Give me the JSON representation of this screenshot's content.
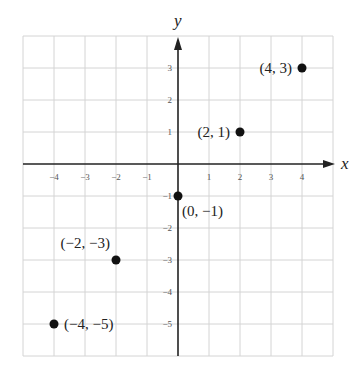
{
  "chart_data": {
    "type": "scatter",
    "title": "",
    "xlabel": "x",
    "ylabel": "y",
    "xlim": [
      -5,
      5
    ],
    "ylim": [
      -6,
      4
    ],
    "grid": true,
    "x_ticks": [
      -4,
      -3,
      -2,
      -1,
      1,
      2,
      3,
      4
    ],
    "x_tick_labels": [
      "−4",
      "−3",
      "−2",
      "−1",
      "1",
      "2",
      "3",
      "4"
    ],
    "y_ticks": [
      3,
      2,
      1,
      -1,
      -2,
      -3,
      -4,
      -5
    ],
    "y_tick_labels": [
      "3",
      "2",
      "1",
      "−1",
      "−2",
      "−3",
      "−4",
      "−5"
    ],
    "points": [
      {
        "x": 4,
        "y": 3,
        "label": "(4, 3)",
        "label_pos": "left"
      },
      {
        "x": 2,
        "y": 1,
        "label": "(2, 1)",
        "label_pos": "left"
      },
      {
        "x": 0,
        "y": -1,
        "label": "(0, −1)",
        "label_pos": "below-right"
      },
      {
        "x": -2,
        "y": -3,
        "label": "(−2, −3)",
        "label_pos": "above-left"
      },
      {
        "x": -4,
        "y": -5,
        "label": "(−4, −5)",
        "label_pos": "right"
      }
    ],
    "colors": {
      "grid": "#d4d4d4",
      "axis": "#222222",
      "point": "#111111",
      "text": "#222222"
    }
  }
}
